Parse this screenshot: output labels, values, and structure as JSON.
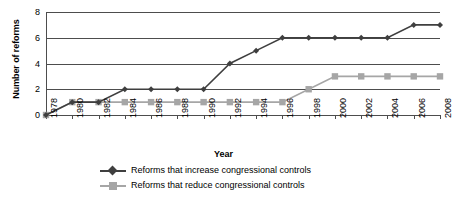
{
  "chart_data": {
    "type": "line",
    "title": "",
    "xlabel": "Year",
    "ylabel": "Number of reforms",
    "x": [
      1978,
      1980,
      1982,
      1984,
      1986,
      1988,
      1990,
      1992,
      1994,
      1996,
      1998,
      2000,
      2002,
      2004,
      2006,
      2008
    ],
    "xtick_labels": [
      "1978",
      "1980",
      "1982",
      "1984",
      "1986",
      "1988",
      "1990",
      "1992",
      "1994",
      "1996",
      "1998",
      "2000",
      "2002",
      "2004",
      "2006",
      "2008"
    ],
    "ytick_labels": [
      "0",
      "2",
      "4",
      "6",
      "8"
    ],
    "yticks": [
      0,
      2,
      4,
      6,
      8
    ],
    "ylim": [
      0,
      8
    ],
    "xlim": [
      1978,
      2008
    ],
    "grid": true,
    "legend_position": "bottom",
    "series": [
      {
        "name": "Reforms that increase congressional controls",
        "color": "#3f3f3f",
        "marker": "diamond",
        "values": [
          0,
          1,
          1,
          2,
          2,
          2,
          2,
          4,
          5,
          6,
          6,
          6,
          6,
          6,
          7,
          7
        ]
      },
      {
        "name": "Reforms that reduce congressional controls",
        "color": "#a6a6a6",
        "marker": "square",
        "values": [
          0,
          1,
          1,
          1,
          1,
          1,
          1,
          1,
          1,
          1,
          2,
          3,
          3,
          3,
          3,
          3
        ]
      }
    ]
  },
  "axes": {
    "y_title": "Number of reforms",
    "x_title": "Year"
  },
  "legend": {
    "items": [
      {
        "label": "Reforms that increase congressional controls"
      },
      {
        "label": "Reforms that reduce congressional controls"
      }
    ]
  },
  "colors": {
    "series_increase": "#3f3f3f",
    "series_reduce": "#a6a6a6",
    "axis": "#4d4d4d",
    "background": "#ffffff"
  }
}
